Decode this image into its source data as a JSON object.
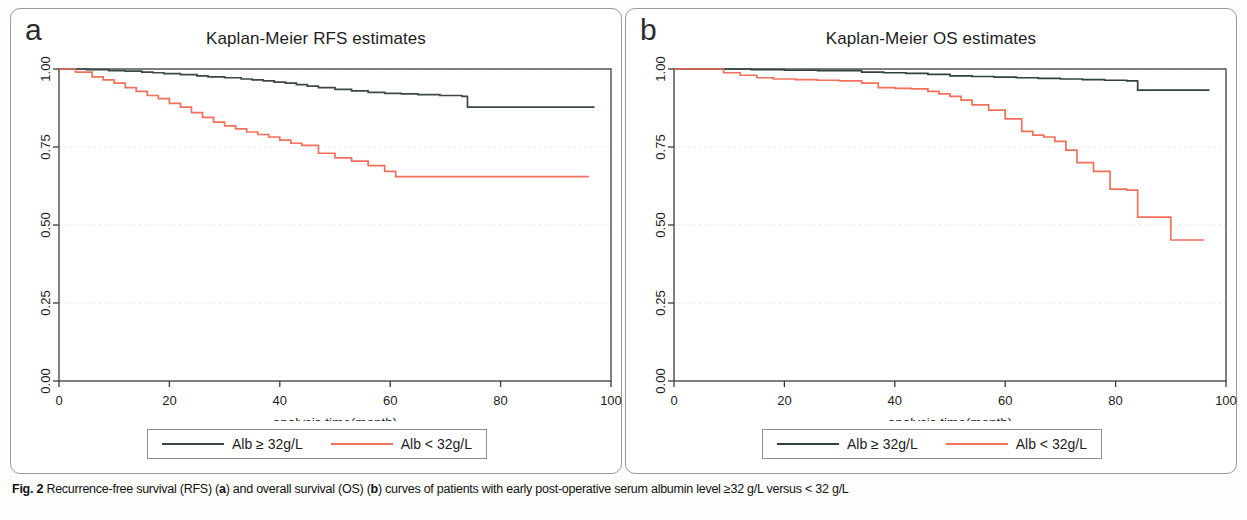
{
  "figure": {
    "caption_prefix": "Fig. 2",
    "caption_part1": " Recurrence-free survival (RFS) (",
    "caption_a": "a",
    "caption_part2": ") and overall survival (OS) (",
    "caption_b": "b",
    "caption_part3": ") curves of patients with early post-operative serum albumin level ≥32 g/L versus < 32 g/L"
  },
  "colors": {
    "high_albumin_a": "#3d4648",
    "high_albumin_b": "#2f4338",
    "low_albumin": "#f2705c",
    "axis": "#3a3a3a",
    "grid": "#e8e4e0",
    "frame": "#4a4a4a"
  },
  "panels": [
    {
      "letter": "a",
      "title": "Kaplan-Meier RFS estimates",
      "xlabel": "analysis time(month)",
      "xticks": [
        "0",
        "20",
        "40",
        "60",
        "80",
        "100"
      ],
      "yticks": [
        "0.00",
        "0.25",
        "0.50",
        "0.75",
        "1.00"
      ],
      "legend": [
        {
          "label": "Alb ≥ 32g/L",
          "color_key": "high_albumin_a"
        },
        {
          "label": "Alb < 32g/L",
          "color_key": "low_albumin"
        }
      ]
    },
    {
      "letter": "b",
      "title": "Kaplan-Meier OS estimates",
      "xlabel": "analysis time(month)",
      "xticks": [
        "0",
        "20",
        "40",
        "60",
        "80",
        "100"
      ],
      "yticks": [
        "0.00",
        "0.25",
        "0.50",
        "0.75",
        "1.00"
      ],
      "legend": [
        {
          "label": "Alb ≥ 32g/L",
          "color_key": "high_albumin_b"
        },
        {
          "label": "Alb < 32g/L",
          "color_key": "low_albumin"
        }
      ]
    }
  ],
  "chart_data": [
    {
      "type": "line",
      "title": "Kaplan-Meier RFS estimates",
      "panel": "a",
      "xlabel": "analysis time(month)",
      "ylabel": "",
      "xlim": [
        0,
        100
      ],
      "ylim": [
        0,
        1
      ],
      "xticks": [
        0,
        20,
        40,
        60,
        80,
        100
      ],
      "yticks": [
        0,
        0.25,
        0.5,
        0.75,
        1.0
      ],
      "grid": true,
      "legend_position": "below-plot",
      "series": [
        {
          "name": "Alb ≥ 32g/L",
          "color": "#3d4648",
          "step": "post",
          "x": [
            0,
            2,
            5,
            9,
            12,
            15,
            17,
            19,
            22,
            25,
            27,
            30,
            33,
            35,
            37,
            39,
            41,
            43,
            45,
            47,
            50,
            53,
            56,
            59,
            62,
            65,
            69,
            73,
            74,
            80,
            88,
            97
          ],
          "y": [
            1.0,
            1.0,
            0.998,
            0.995,
            0.993,
            0.99,
            0.988,
            0.985,
            0.982,
            0.978,
            0.975,
            0.972,
            0.968,
            0.965,
            0.962,
            0.958,
            0.955,
            0.95,
            0.945,
            0.94,
            0.935,
            0.93,
            0.925,
            0.922,
            0.92,
            0.918,
            0.915,
            0.912,
            0.878,
            0.878,
            0.878,
            0.878
          ]
        },
        {
          "name": "Alb < 32g/L",
          "color": "#f2705c",
          "step": "post",
          "x": [
            0,
            3,
            6,
            8,
            10,
            12,
            14,
            16,
            18,
            20,
            22,
            24,
            26,
            28,
            30,
            32,
            34,
            36,
            38,
            40,
            42,
            44,
            47,
            50,
            53,
            56,
            59,
            61,
            66,
            75,
            85,
            96
          ],
          "y": [
            1.0,
            0.99,
            0.975,
            0.965,
            0.955,
            0.94,
            0.928,
            0.915,
            0.905,
            0.89,
            0.878,
            0.86,
            0.845,
            0.83,
            0.818,
            0.808,
            0.798,
            0.79,
            0.782,
            0.772,
            0.762,
            0.755,
            0.73,
            0.715,
            0.705,
            0.69,
            0.672,
            0.655,
            0.655,
            0.655,
            0.655,
            0.655
          ]
        }
      ]
    },
    {
      "type": "line",
      "title": "Kaplan-Meier OS estimates",
      "panel": "b",
      "xlabel": "analysis time(month)",
      "ylabel": "",
      "xlim": [
        0,
        100
      ],
      "ylim": [
        0,
        1
      ],
      "xticks": [
        0,
        20,
        40,
        60,
        80,
        100
      ],
      "yticks": [
        0,
        0.25,
        0.5,
        0.75,
        1.0
      ],
      "grid": true,
      "legend_position": "below-plot",
      "series": [
        {
          "name": "Alb ≥ 32g/L",
          "color": "#2f4338",
          "step": "post",
          "x": [
            0,
            8,
            14,
            20,
            26,
            31,
            34,
            38,
            42,
            46,
            50,
            54,
            58,
            62,
            66,
            70,
            74,
            78,
            82,
            84,
            90,
            97
          ],
          "y": [
            1.0,
            1.0,
            0.998,
            0.996,
            0.995,
            0.995,
            0.99,
            0.988,
            0.986,
            0.983,
            0.978,
            0.976,
            0.974,
            0.972,
            0.97,
            0.968,
            0.966,
            0.964,
            0.962,
            0.932,
            0.932,
            0.932
          ]
        },
        {
          "name": "Alb < 32g/L",
          "color": "#f2705c",
          "step": "post",
          "x": [
            0,
            6,
            9,
            12,
            15,
            18,
            22,
            26,
            30,
            34,
            37,
            40,
            43,
            46,
            48,
            50,
            52,
            54,
            57,
            60,
            63,
            65,
            67,
            69,
            71,
            73,
            76,
            79,
            82,
            84,
            90,
            96
          ],
          "y": [
            1.0,
            1.0,
            0.988,
            0.98,
            0.972,
            0.968,
            0.966,
            0.964,
            0.962,
            0.955,
            0.94,
            0.938,
            0.936,
            0.928,
            0.92,
            0.912,
            0.9,
            0.885,
            0.868,
            0.84,
            0.8,
            0.788,
            0.782,
            0.768,
            0.74,
            0.7,
            0.672,
            0.615,
            0.612,
            0.525,
            0.452,
            0.452
          ]
        }
      ]
    }
  ]
}
